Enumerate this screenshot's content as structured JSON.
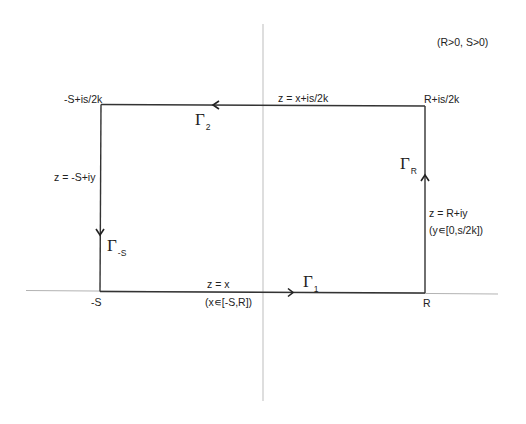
{
  "diagram": {
    "type": "contour-integration-rectangle",
    "colors": {
      "background": "#ffffff",
      "axis": "#b8b8b8",
      "contour": "#333333",
      "text": "#222222"
    },
    "condition": "(R>0, S>0)",
    "corners": {
      "top_left": "-S+is/2k",
      "top_right": "R+is/2k",
      "bottom_left": "-S",
      "bottom_right": "R"
    },
    "edges": {
      "gamma_1": {
        "symbol": "Γ",
        "subscript": "1",
        "equation": "z = x",
        "range": "(x∊[-S,R])",
        "direction": "right"
      },
      "gamma_R": {
        "symbol": "Γ",
        "subscript": "R",
        "equation": "z = R+iy",
        "range": "(y∊[0,s/2k])",
        "direction": "up"
      },
      "gamma_2": {
        "symbol": "Γ",
        "subscript": "2",
        "equation": "z = x+is/2k",
        "direction": "left"
      },
      "gamma_neg_S": {
        "symbol": "Γ",
        "subscript": "-S",
        "equation": "z = -S+iy",
        "direction": "down"
      }
    }
  }
}
